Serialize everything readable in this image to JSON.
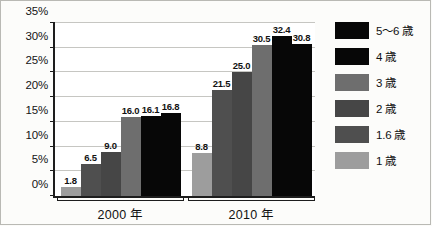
{
  "chart_data": {
    "type": "bar",
    "title": "",
    "xlabel": "",
    "ylabel": "",
    "categories": [
      "2000 年",
      "2010 年"
    ],
    "ylim": [
      0,
      35
    ],
    "ytick_step": 5,
    "ytick_labels": [
      "0%",
      "5%",
      "10%",
      "15%",
      "20%",
      "25%",
      "30%",
      "35%"
    ],
    "ytick_values": [
      0,
      5,
      10,
      15,
      20,
      25,
      30,
      35
    ],
    "grid": true,
    "legend_position": "right",
    "series": [
      {
        "name": "1 歳",
        "color": "#9d9d9d",
        "values": [
          1.8,
          8.8
        ],
        "labels": [
          "1.8",
          "8.8"
        ]
      },
      {
        "name": "1.6 歳",
        "color": "#4f4f4f",
        "values": [
          6.5,
          21.5
        ],
        "labels": [
          "6.5",
          "21.5"
        ]
      },
      {
        "name": "2 歳",
        "color": "#464646",
        "values": [
          9.0,
          25.0
        ],
        "labels": [
          "9.0",
          "25.0"
        ]
      },
      {
        "name": "3 歳",
        "color": "#6e6e6e",
        "values": [
          16.0,
          30.5
        ],
        "labels": [
          "16.0",
          "30.5"
        ]
      },
      {
        "name": "4 歳",
        "color": "#070707",
        "values": [
          16.1,
          32.4
        ],
        "labels": [
          "16.1",
          "32.4"
        ]
      },
      {
        "name": "5～6 歳",
        "color": "#070707",
        "values": [
          16.8,
          30.8
        ],
        "labels": [
          "16.8",
          "30.8"
        ]
      }
    ],
    "legend_order": [
      "5～6 歳",
      "4 歳",
      "3 歳",
      "2 歳",
      "1.6 歳",
      "1 歳"
    ],
    "legend_entries": [
      {
        "label": "5～6 歳",
        "color": "#070707"
      },
      {
        "label": "4 歳",
        "color": "#070707"
      },
      {
        "label": "3 歳",
        "color": "#6e6e6e"
      },
      {
        "label": "2 歳",
        "color": "#464646"
      },
      {
        "label": "1.6 歳",
        "color": "#4f4f4f"
      },
      {
        "label": "1 歳",
        "color": "#9d9d9d"
      }
    ]
  }
}
